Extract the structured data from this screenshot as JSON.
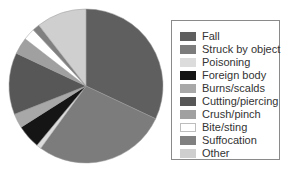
{
  "chart_data": {
    "type": "pie",
    "title": "",
    "start_angle_deg": 0,
    "direction": "clockwise",
    "center": [
      86,
      86
    ],
    "radius": 77,
    "legend_position": "right",
    "slices": [
      {
        "label": "Fall",
        "value": 32,
        "color": "#5f5f5f"
      },
      {
        "label": "Struck by object",
        "value": 28,
        "color": "#7c7c7c"
      },
      {
        "label": "Poisoning",
        "value": 1,
        "color": "#dcdcdc"
      },
      {
        "label": "Foreign body",
        "value": 5,
        "color": "#151515"
      },
      {
        "label": "Burns/scalds",
        "value": 3,
        "color": "#a8a8a8"
      },
      {
        "label": "Cutting/piercing",
        "value": 13,
        "color": "#575757"
      },
      {
        "label": "Crush/pinch",
        "value": 3.5,
        "color": "#a0a0a0"
      },
      {
        "label": "Bite/sting",
        "value": 2.5,
        "color": "#ffffff"
      },
      {
        "label": "Suffocation",
        "value": 1.5,
        "color": "#808080"
      },
      {
        "label": "Other",
        "value": 10.5,
        "color": "#cfcfcf"
      }
    ]
  },
  "legend": {
    "items": [
      {
        "label": "Fall",
        "color": "#5f5f5f"
      },
      {
        "label": "Struck by object",
        "color": "#7c7c7c"
      },
      {
        "label": "Poisoning",
        "color": "#dcdcdc"
      },
      {
        "label": "Foreign body",
        "color": "#151515"
      },
      {
        "label": "Burns/scalds",
        "color": "#a8a8a8"
      },
      {
        "label": "Cutting/piercing",
        "color": "#575757"
      },
      {
        "label": "Crush/pinch",
        "color": "#a0a0a0"
      },
      {
        "label": "Bite/sting",
        "color": "#ffffff"
      },
      {
        "label": "Suffocation",
        "color": "#808080"
      },
      {
        "label": "Other",
        "color": "#cfcfcf"
      }
    ]
  }
}
